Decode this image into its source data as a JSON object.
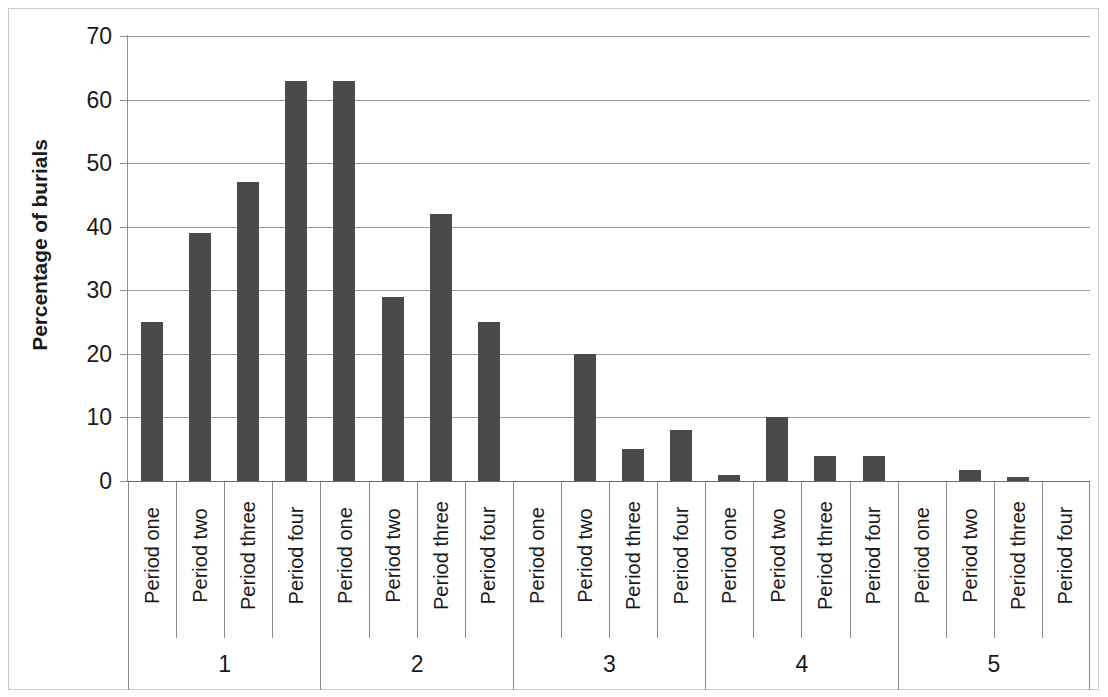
{
  "chart_data": {
    "type": "bar",
    "title": "",
    "subtitle": "",
    "xlabel": "",
    "ylabel": "Percentage of burials",
    "ylim": [
      0,
      70
    ],
    "ytick_labels": [
      "0",
      "10",
      "20",
      "30",
      "40",
      "50",
      "60",
      "70"
    ],
    "ytick_values": [
      0,
      10,
      20,
      30,
      40,
      50,
      60,
      70
    ],
    "grid": true,
    "legend": false,
    "legend_position": "none",
    "bar_color": "#4a4a4a",
    "gridline_color": "#9d9d9d",
    "axis_color": "#6d6d6d",
    "group_labels": [
      "1",
      "2",
      "3",
      "4",
      "5"
    ],
    "categories": [
      "Period one",
      "Period two",
      "Period three",
      "Period four",
      "Period one",
      "Period two",
      "Period three",
      "Period four",
      "Period one",
      "Period two",
      "Period three",
      "Period four",
      "Period one",
      "Period two",
      "Period three",
      "Period four",
      "Period one",
      "Period two",
      "Period three",
      "Period four"
    ],
    "values": [
      25,
      39,
      47,
      63,
      63,
      29,
      42,
      25,
      0,
      20,
      5,
      8,
      1,
      10,
      4,
      4,
      0,
      1.7,
      0.6,
      0
    ],
    "groups": [
      {
        "label": "1",
        "categories": [
          "Period one",
          "Period two",
          "Period three",
          "Period four"
        ],
        "values": [
          25,
          39,
          47,
          63
        ]
      },
      {
        "label": "2",
        "categories": [
          "Period one",
          "Period two",
          "Period three",
          "Period four"
        ],
        "values": [
          63,
          29,
          42,
          25
        ]
      },
      {
        "label": "3",
        "categories": [
          "Period one",
          "Period two",
          "Period three",
          "Period four"
        ],
        "values": [
          0,
          20,
          5,
          8
        ]
      },
      {
        "label": "4",
        "categories": [
          "Period one",
          "Period two",
          "Period three",
          "Period four"
        ],
        "values": [
          1,
          10,
          4,
          4
        ]
      },
      {
        "label": "5",
        "categories": [
          "Period one",
          "Period two",
          "Period three",
          "Period four"
        ],
        "values": [
          0,
          1.7,
          0.6,
          0
        ]
      }
    ]
  }
}
